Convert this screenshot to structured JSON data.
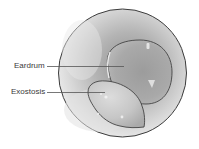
{
  "figure": {
    "labels": [
      {
        "id": "eardrum",
        "text": "Eardrum"
      },
      {
        "id": "exostosis",
        "text": "Exostosis"
      }
    ],
    "colors": {
      "outline": "#3c3c3c",
      "canal_light": "#e6e6e6",
      "canal_dark": "#9a9a9a",
      "eardrum_fill": "#a8a8a8",
      "exostosis_fill": "#c8c8c8",
      "label_text": "#3a3a3a",
      "leader_line": "#555555"
    }
  }
}
